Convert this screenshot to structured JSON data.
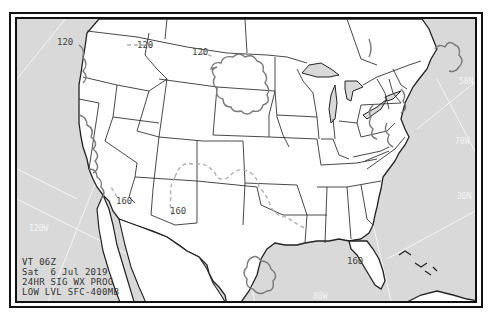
{
  "chart": {
    "title": "24HR SIG WX PROG",
    "caption_lines": [
      "VT 06Z",
      "Sat  6 Jul 2019",
      "24HR SIG WX PROG",
      "LOW LVL SFC-400MB"
    ],
    "valid_time": "VT 06Z",
    "date": "Sat  6 Jul 2019",
    "product": "24HR SIG WX PROG",
    "level": "LOW LVL SFC-400MB"
  },
  "freezing_level_labels": [
    {
      "text": "120",
      "x": 52,
      "y": 26
    },
    {
      "text": "120",
      "x": 118,
      "y": 28
    },
    {
      "text": "120",
      "x": 178,
      "y": 36
    },
    {
      "text": "160",
      "x": 100,
      "y": 184
    },
    {
      "text": "160",
      "x": 154,
      "y": 192
    },
    {
      "text": "160",
      "x": 330,
      "y": 244
    }
  ],
  "graticule_labels": [
    {
      "text": "50N",
      "x": 448,
      "y": 65
    },
    {
      "text": "70W",
      "x": 442,
      "y": 126
    },
    {
      "text": "30N",
      "x": 446,
      "y": 180
    },
    {
      "text": "120W",
      "x": 16,
      "y": 210
    },
    {
      "text": "80W",
      "x": 298,
      "y": 280
    }
  ],
  "colors": {
    "water": "#d9d9d9",
    "land": "#ffffff",
    "border": "#333333",
    "coast": "#222222",
    "freezing_line": "#b0b0b0",
    "weather_outline": "#7a7a7a",
    "graticule": "#f2f2f2",
    "frame": "#111111"
  }
}
